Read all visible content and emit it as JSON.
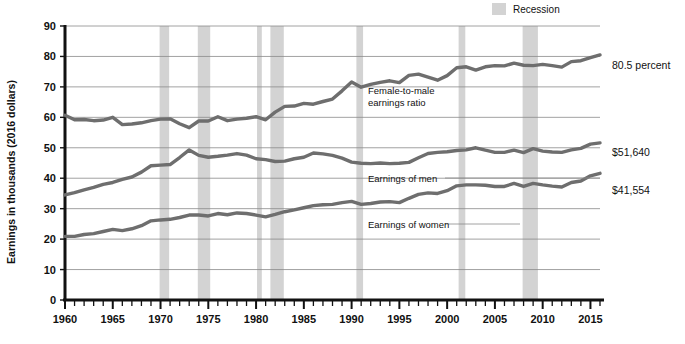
{
  "chart_data": {
    "type": "line",
    "title": "",
    "xlabel": "",
    "ylabel": "Earnings in thousands (2016 dollars)",
    "xlim": [
      1960,
      2016
    ],
    "ylim": [
      0,
      90
    ],
    "ytick_step": 10,
    "yticks": [
      "0",
      "10",
      "20",
      "30",
      "40",
      "50",
      "60",
      "70",
      "80",
      "90"
    ],
    "xticks_major": [
      "1960",
      "1965",
      "1970",
      "1975",
      "1980",
      "1985",
      "1990",
      "1995",
      "2000",
      "2005",
      "2010",
      "2015"
    ],
    "xtick_minor_step": 1,
    "grid": "horizontal",
    "legend_position": "top-right",
    "x": [
      1960,
      1961,
      1962,
      1963,
      1964,
      1965,
      1966,
      1967,
      1968,
      1969,
      1970,
      1971,
      1972,
      1973,
      1974,
      1975,
      1976,
      1977,
      1978,
      1979,
      1980,
      1981,
      1982,
      1983,
      1984,
      1985,
      1986,
      1987,
      1988,
      1989,
      1990,
      1991,
      1992,
      1993,
      1994,
      1995,
      1996,
      1997,
      1998,
      1999,
      2000,
      2001,
      2002,
      2003,
      2004,
      2005,
      2006,
      2007,
      2008,
      2009,
      2010,
      2011,
      2012,
      2013,
      2014,
      2015,
      2016
    ],
    "series": [
      {
        "name": "Female-to-male earnings ratio",
        "units": "percent",
        "color": "#6e6e6e",
        "end_label": "80.5 percent",
        "inline_label": "Female-to-male earnings ratio",
        "values": [
          60.7,
          59.2,
          59.3,
          58.9,
          59.1,
          60.0,
          57.6,
          57.8,
          58.2,
          58.9,
          59.4,
          59.5,
          57.9,
          56.6,
          58.8,
          58.8,
          60.2,
          58.9,
          59.4,
          59.7,
          60.2,
          59.2,
          61.7,
          63.6,
          63.7,
          64.6,
          64.3,
          65.2,
          66.0,
          68.7,
          71.6,
          69.9,
          70.8,
          71.5,
          72.0,
          71.4,
          73.8,
          74.2,
          73.2,
          72.2,
          73.7,
          76.3,
          76.6,
          75.5,
          76.6,
          77.0,
          76.9,
          77.8,
          77.1,
          77.0,
          77.4,
          77.0,
          76.5,
          78.3,
          78.6,
          79.6,
          80.5
        ]
      },
      {
        "name": "Earnings of men",
        "units": "thousands of 2016 dollars",
        "color": "#6e6e6e",
        "end_label": "$51,640",
        "inline_label": "Earnings of men",
        "values": [
          34.5,
          35.3,
          36.2,
          37.0,
          38.0,
          38.6,
          39.6,
          40.4,
          42.0,
          44.1,
          44.3,
          44.5,
          46.8,
          49.3,
          47.5,
          46.9,
          47.2,
          47.6,
          48.1,
          47.6,
          46.4,
          46.1,
          45.5,
          45.6,
          46.4,
          46.9,
          48.3,
          48.0,
          47.5,
          46.6,
          45.3,
          44.9,
          44.8,
          45.0,
          44.8,
          44.9,
          45.2,
          46.7,
          48.1,
          48.5,
          48.7,
          49.1,
          49.3,
          50.0,
          49.2,
          48.5,
          48.5,
          49.2,
          48.4,
          49.7,
          48.9,
          48.6,
          48.5,
          49.3,
          49.8,
          51.2,
          51.6
        ]
      },
      {
        "name": "Earnings of women",
        "units": "thousands of 2016 dollars",
        "color": "#6e6e6e",
        "end_label": "$41,554",
        "inline_label": "Earnings of women",
        "values": [
          20.9,
          20.9,
          21.5,
          21.8,
          22.5,
          23.2,
          22.8,
          23.4,
          24.4,
          26.0,
          26.3,
          26.5,
          27.1,
          27.9,
          27.9,
          27.6,
          28.4,
          28.0,
          28.6,
          28.4,
          27.9,
          27.3,
          28.1,
          29.0,
          29.6,
          30.3,
          31.0,
          31.3,
          31.4,
          32.0,
          32.4,
          31.4,
          31.7,
          32.2,
          32.3,
          32.0,
          33.4,
          34.7,
          35.2,
          35.0,
          35.9,
          37.5,
          37.8,
          37.8,
          37.7,
          37.3,
          37.3,
          38.3,
          37.3,
          38.3,
          37.8,
          37.4,
          37.1,
          38.6,
          39.1,
          40.8,
          41.6
        ]
      }
    ],
    "recessions": [
      {
        "start": 1969.9,
        "end": 1970.9
      },
      {
        "start": 1973.9,
        "end": 1975.2
      },
      {
        "start": 1980.1,
        "end": 1980.6
      },
      {
        "start": 1981.5,
        "end": 1982.9
      },
      {
        "start": 1990.5,
        "end": 1991.2
      },
      {
        "start": 2001.2,
        "end": 2001.9
      },
      {
        "start": 2007.9,
        "end": 2009.5
      }
    ],
    "recession_color": "#d3d3d3",
    "gridline_color": "#8a8a8a",
    "axis_color": "#111111"
  },
  "legend": {
    "swatch_name": "recession-swatch",
    "label": "Recession"
  },
  "annotations": {
    "ratio_line1": "Female-to-male",
    "ratio_line2": "earnings ratio",
    "men": "Earnings of men",
    "women": "Earnings of women",
    "end_ratio": "80.5 percent",
    "end_men": "$51,640",
    "end_women": "$41,554"
  },
  "axes": {
    "y_title": "Earnings in thousands (2016 dollars)"
  }
}
